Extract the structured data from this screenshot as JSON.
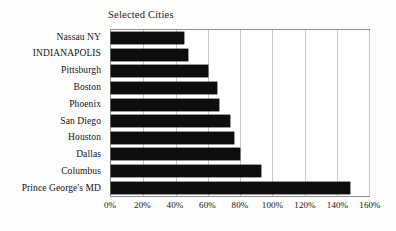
{
  "chart_data": {
    "type": "bar",
    "orientation": "horizontal",
    "title": "Selected Cities",
    "xlabel": "",
    "ylabel": "",
    "xlim": [
      0,
      160
    ],
    "xticks": [
      "0%",
      "20%",
      "40%",
      "60%",
      "80%",
      "100%",
      "120%",
      "140%",
      "160%"
    ],
    "xtick_values": [
      0,
      20,
      40,
      60,
      80,
      100,
      120,
      140,
      160
    ],
    "grid": true,
    "legend": false,
    "categories": [
      "Nassau NY",
      "INDIANAPOLIS",
      "Pittsburgh",
      "Boston",
      "Phoenix",
      "San Diego",
      "Houston",
      "Dallas",
      "Columbus",
      "Prince George's MD"
    ],
    "values": [
      45,
      48,
      60,
      66,
      67,
      74,
      76,
      80,
      93,
      148
    ],
    "bar_color": "#0d0d0d"
  }
}
